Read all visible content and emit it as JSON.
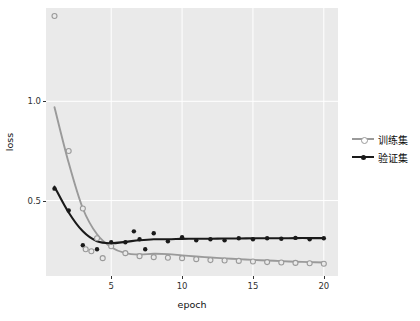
{
  "chart_data": {
    "type": "scatter",
    "title": "",
    "xlabel": "epoch",
    "ylabel": "loss",
    "xlim": [
      0.4,
      21.0
    ],
    "ylim": [
      0.12,
      1.47
    ],
    "xticks": [
      5,
      10,
      15,
      20
    ],
    "yticks": [
      0.5,
      1.0
    ],
    "grid": true,
    "legend_position": "right",
    "background": "#eaeaea",
    "series": [
      {
        "name": "训练集",
        "color": "#9a9a9a",
        "marker": "circle-open",
        "x": [
          1,
          2,
          3,
          4,
          5,
          6,
          7,
          8,
          9,
          10,
          11,
          12,
          13,
          14,
          15,
          16,
          17,
          18,
          19,
          20
        ],
        "y": [
          1.43,
          0.75,
          0.46,
          0.31,
          0.27,
          0.235,
          0.22,
          0.215,
          0.212,
          0.21,
          0.205,
          0.2,
          0.198,
          0.196,
          0.193,
          0.19,
          0.188,
          0.186,
          0.184,
          0.182
        ],
        "smooth_y": [
          0.97,
          0.69,
          0.46,
          0.33,
          0.265,
          0.235,
          0.228,
          0.232,
          0.23,
          0.224,
          0.218,
          0.213,
          0.209,
          0.205,
          0.201,
          0.198,
          0.195,
          0.192,
          0.19,
          0.188
        ]
      },
      {
        "name": "验证集",
        "color": "#1a1a1a",
        "marker": "circle-filled",
        "x": [
          1,
          2,
          3,
          4,
          5,
          6,
          7,
          8,
          9,
          10,
          11,
          12,
          13,
          14,
          15,
          16,
          17,
          18,
          19,
          20
        ],
        "y": [
          0.56,
          0.45,
          0.275,
          0.255,
          0.29,
          0.29,
          0.305,
          0.335,
          0.295,
          0.315,
          0.3,
          0.305,
          0.3,
          0.31,
          0.305,
          0.31,
          0.308,
          0.312,
          0.305,
          0.31
        ],
        "smooth_y": [
          0.57,
          0.44,
          0.345,
          0.295,
          0.285,
          0.292,
          0.3,
          0.305,
          0.305,
          0.307,
          0.308,
          0.308,
          0.309,
          0.309,
          0.31,
          0.31,
          0.31,
          0.311,
          0.311,
          0.311
        ]
      }
    ],
    "extra_points": [
      {
        "series": "训练集",
        "x": 3.2,
        "y": 0.255
      },
      {
        "series": "训练集",
        "x": 3.6,
        "y": 0.245
      },
      {
        "series": "训练集",
        "x": 4.4,
        "y": 0.21
      },
      {
        "series": "验证集",
        "x": 6.6,
        "y": 0.345
      },
      {
        "series": "验证集",
        "x": 7.4,
        "y": 0.255
      }
    ]
  },
  "legend": {
    "items": [
      {
        "label": "训练集",
        "color": "#9a9a9a"
      },
      {
        "label": "验证集",
        "color": "#1a1a1a"
      }
    ]
  },
  "axes": {
    "xlabel": "epoch",
    "ylabel": "loss",
    "xtick_labels": [
      "5",
      "10",
      "15",
      "20"
    ],
    "ytick_labels": [
      "0.5",
      "1.0"
    ]
  }
}
